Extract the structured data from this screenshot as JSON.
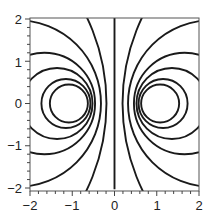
{
  "chart_data": {
    "type": "contour",
    "title": "",
    "xlabel": "",
    "ylabel": "",
    "xlim": [
      -2,
      2
    ],
    "ylim": [
      -2,
      2
    ],
    "grid": false,
    "legend": null,
    "x_ticks": [
      -2,
      -1,
      0,
      1,
      2
    ],
    "y_ticks": [
      -2,
      -1,
      0,
      1,
      2
    ],
    "x_tick_labels": [
      "−2",
      "−1",
      "0",
      "1",
      "2"
    ],
    "y_tick_labels": [
      "−2",
      "−1",
      "0",
      "1",
      "2"
    ],
    "minor_tick_step": 0.2,
    "line_color": "#1a1a1a",
    "contours": [
      {
        "kind": "line",
        "x": 0
      },
      {
        "kind": "circle",
        "cx": 1.08,
        "cy": 0,
        "r": 0.45
      },
      {
        "kind": "circle",
        "cx": 1.15,
        "cy": 0,
        "r": 0.58
      },
      {
        "kind": "circle",
        "cx": 1.36,
        "cy": 0,
        "r": 0.84
      },
      {
        "kind": "circle",
        "cx": 1.66,
        "cy": 0,
        "r": 1.2
      },
      {
        "kind": "circle",
        "cx": 2.29,
        "cy": 0,
        "r": 1.97
      },
      {
        "kind": "circle",
        "cx": 4.9,
        "cy": 0,
        "r": 4.71
      },
      {
        "kind": "circle",
        "cx": -1.08,
        "cy": 0,
        "r": 0.45
      },
      {
        "kind": "circle",
        "cx": -1.15,
        "cy": 0,
        "r": 0.58
      },
      {
        "kind": "circle",
        "cx": -1.36,
        "cy": 0,
        "r": 0.84
      },
      {
        "kind": "circle",
        "cx": -1.66,
        "cy": 0,
        "r": 1.2
      },
      {
        "kind": "circle",
        "cx": -2.29,
        "cy": 0,
        "r": 1.97
      },
      {
        "kind": "circle",
        "cx": -4.9,
        "cy": 0,
        "r": 4.71
      }
    ]
  },
  "axes": {
    "x_labels": [
      "−2",
      "−1",
      "0",
      "1",
      "2"
    ],
    "y_labels": [
      "2",
      "1",
      "0",
      "−1",
      "−2"
    ]
  }
}
